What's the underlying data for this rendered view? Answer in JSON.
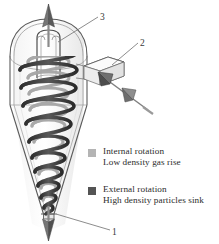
{
  "figure": {
    "kind": "cyclone-separator-cutaway-diagram",
    "title": "",
    "callouts": [
      {
        "id": "3",
        "label": "3",
        "target": "clean-gas-outlet-top",
        "x": 100,
        "y": 12
      },
      {
        "id": "2",
        "label": "2",
        "target": "tangential-inlet-duct",
        "x": 140,
        "y": 38
      },
      {
        "id": "1",
        "label": "1",
        "target": "particle-outlet-bottom",
        "x": 112,
        "y": 227
      }
    ],
    "flows": {
      "top_arrow": "up",
      "bottom_arrow": "down",
      "inlet_arrows": "into-duct"
    }
  },
  "legend": {
    "entries": [
      {
        "swatch_color": "#b4b4b4",
        "line1": "Internal rotation",
        "line2": "Low density gas rise"
      },
      {
        "swatch_color": "#545454",
        "line1": "External rotation",
        "line2": "High density particles sink"
      }
    ]
  },
  "colors": {
    "outline": "#555555",
    "inner_helix": "#9a9a9a",
    "outer_helix": "#3a3a3a",
    "arrow_fill": "#6e6e6e",
    "text": "#2b2b2b",
    "background": "#ffffff"
  }
}
